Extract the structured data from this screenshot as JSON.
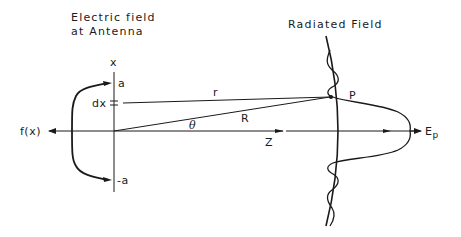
{
  "titles": {
    "left_line1": "Electric field",
    "left_line2": "at Antenna",
    "right": "Radiated Field"
  },
  "labels": {
    "x_axis": "x",
    "a_top": "a",
    "a_bottom": "-a",
    "dx": "dx",
    "fx": "f(x)",
    "r": "r",
    "R": "R",
    "theta": "θ",
    "Z": "Z",
    "P": "P",
    "E": "E",
    "E_sub": "p"
  },
  "colors": {
    "ink": "#1a1a1a",
    "background": "#ffffff"
  }
}
